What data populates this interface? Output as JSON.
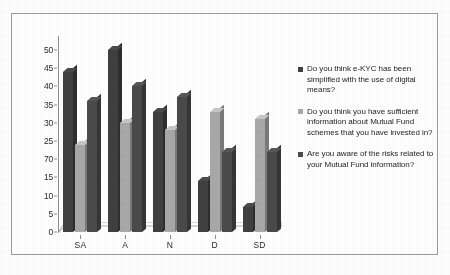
{
  "chart_data": {
    "type": "bar",
    "title": "",
    "subtitle": "",
    "xlabel": "",
    "ylabel": "",
    "categories": [
      "SA",
      "A",
      "N",
      "D",
      "SD"
    ],
    "series": [
      {
        "name": "Do you think e-KYC has been simplified with the use of digital means?",
        "color": "#3f3f3f",
        "values": [
          44,
          50,
          33,
          14,
          7
        ]
      },
      {
        "name": "Do you think you have sufficient information about Mutual Fund schemes that you have invested in?",
        "color": "#a8a8a8",
        "values": [
          24,
          30,
          28,
          33,
          31
        ]
      },
      {
        "name": "Are you aware of the risks related to your Mutual Fund information?",
        "color": "#4a4a4a",
        "values": [
          36,
          40,
          37,
          22,
          22
        ]
      }
    ],
    "ylim": [
      0,
      50
    ],
    "yticks": [
      0,
      5,
      10,
      15,
      20,
      25,
      30,
      35,
      40,
      45,
      50
    ],
    "ytick_labels": [
      "0",
      "5",
      "10",
      "15",
      "70",
      "25",
      "30",
      "35",
      "40",
      "45",
      "50"
    ],
    "grid": false,
    "legend_position": "right",
    "style_3d": true
  },
  "axes": {
    "y_axis_name": "y-axis",
    "x_axis_name": "x-axis"
  },
  "legend": {
    "entries": [
      {
        "label": "Do you think e-KYC has been simplified with the use of digital means?",
        "swatch": "#3f3f3f"
      },
      {
        "label": "Do you think you have sufficient information about Mutual Fund schemes that you have invested in?",
        "swatch": "#a8a8a8"
      },
      {
        "label": "Are you aware of the risks related to your Mutual Fund information?",
        "swatch": "#4a4a4a"
      }
    ]
  },
  "caption": {
    "text": ""
  }
}
